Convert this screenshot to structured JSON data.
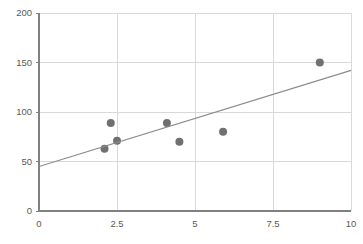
{
  "chart_data": {
    "type": "scatter",
    "title": "",
    "subtitle": "",
    "xlabel": "",
    "ylabel": "",
    "xlim": [
      0,
      10
    ],
    "ylim": [
      0,
      200
    ],
    "x_ticks": [
      0,
      2.5,
      5,
      7.5,
      10
    ],
    "x_tick_labels": [
      "0",
      "2.5",
      "5",
      "7.5",
      "10"
    ],
    "y_ticks": [
      0,
      50,
      100,
      150,
      200
    ],
    "y_tick_labels": [
      "0",
      "50",
      "100",
      "150",
      "200"
    ],
    "grid": {
      "horizontal": true,
      "vertical": true,
      "color": "#D9D9D9"
    },
    "legend": {
      "visible": false,
      "position": "none",
      "entries": []
    },
    "annotations": [],
    "series": [
      {
        "name": "data-points",
        "type": "scatter",
        "marker": "circle",
        "marker_size": 7,
        "color": "#707070",
        "points": [
          {
            "x": 2.1,
            "y": 63
          },
          {
            "x": 2.3,
            "y": 89
          },
          {
            "x": 2.5,
            "y": 71
          },
          {
            "x": 4.1,
            "y": 89
          },
          {
            "x": 4.5,
            "y": 70
          },
          {
            "x": 5.9,
            "y": 80
          },
          {
            "x": 9.0,
            "y": 150
          }
        ]
      },
      {
        "name": "trendline",
        "type": "line",
        "color": "#8C8C8C",
        "width": 1.2,
        "points": [
          {
            "x": 0,
            "y": 45
          },
          {
            "x": 10,
            "y": 142
          }
        ]
      }
    ],
    "axes_style": {
      "axis_color": "#808080",
      "tick_label_color": "#595959",
      "plot_background": "#FFFFFF"
    }
  },
  "geometry": {
    "width": 363,
    "height": 244,
    "plot_left": 39,
    "plot_right": 351,
    "plot_top": 13,
    "plot_bottom": 211
  }
}
